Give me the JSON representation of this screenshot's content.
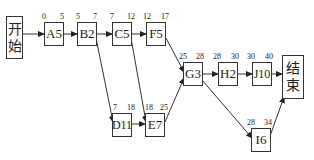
{
  "diagram": {
    "type": "network-schedule",
    "start": {
      "line1": "开",
      "line2": "始"
    },
    "end": {
      "line1": "结",
      "line2": "束"
    },
    "nodes": [
      {
        "id": "A",
        "label": "A5",
        "es": "0",
        "ef": "5"
      },
      {
        "id": "B",
        "label": "B2",
        "es": "5",
        "ef": "7"
      },
      {
        "id": "C",
        "label": "C5",
        "es": "7",
        "ef": "12"
      },
      {
        "id": "F",
        "label": "F5",
        "es": "12",
        "ef": "17"
      },
      {
        "id": "G",
        "label": "G3",
        "es": "25",
        "ef": "28"
      },
      {
        "id": "H",
        "label": "H2",
        "es": "28",
        "ef": "30"
      },
      {
        "id": "J",
        "label": "J10",
        "es": "30",
        "ef": "40"
      },
      {
        "id": "D",
        "label": "D11",
        "es": "7",
        "ef": "18"
      },
      {
        "id": "E",
        "label": "E7",
        "es": "18",
        "ef": "25"
      },
      {
        "id": "I",
        "label": "I6",
        "es": "28",
        "ef": "34"
      }
    ],
    "edges": [
      [
        "start",
        "A"
      ],
      [
        "A",
        "B"
      ],
      [
        "B",
        "C"
      ],
      [
        "C",
        "F"
      ],
      [
        "B",
        "D"
      ],
      [
        "C",
        "E"
      ],
      [
        "D",
        "E"
      ],
      [
        "F",
        "G"
      ],
      [
        "E",
        "G"
      ],
      [
        "G",
        "H"
      ],
      [
        "H",
        "J"
      ],
      [
        "J",
        "end"
      ],
      [
        "G",
        "I"
      ],
      [
        "I",
        "end"
      ]
    ]
  }
}
